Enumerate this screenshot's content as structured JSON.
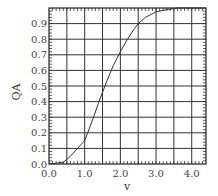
{
  "chart_data": {
    "type": "line",
    "title": "",
    "xlabel": "v",
    "ylabel": "Q_A",
    "xlim": [
      0,
      4.4
    ],
    "ylim": [
      0,
      1.0
    ],
    "x_ticks": [
      "0.0",
      "1.0",
      "2.0",
      "3.0",
      "4.0"
    ],
    "y_ticks": [
      "0.0",
      "0.1",
      "0.2",
      "0.3",
      "0.4",
      "0.5",
      "0.6",
      "0.7",
      "0.8",
      "0.9"
    ],
    "grid": true,
    "series": [
      {
        "name": "Q_A",
        "x": [
          0.0,
          0.4,
          0.6,
          0.8,
          1.0,
          1.2,
          1.4,
          1.6,
          1.8,
          2.0,
          2.2,
          2.4,
          2.5,
          2.7,
          3.0,
          3.3,
          3.6,
          4.0,
          4.4
        ],
        "y": [
          0.0,
          0.01,
          0.05,
          0.1,
          0.15,
          0.27,
          0.4,
          0.52,
          0.63,
          0.72,
          0.8,
          0.87,
          0.9,
          0.94,
          0.975,
          0.99,
          1.0,
          1.0,
          1.0
        ]
      }
    ]
  }
}
